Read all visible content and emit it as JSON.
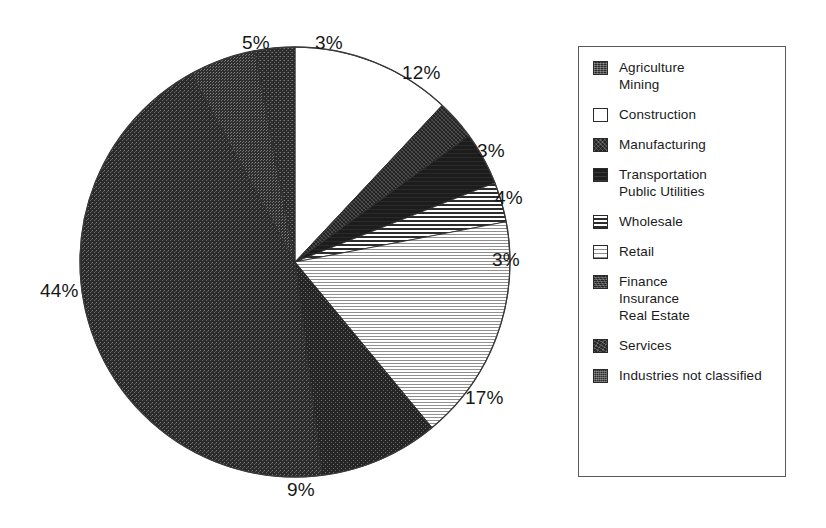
{
  "chart_data": {
    "type": "pie",
    "title": "",
    "subtitle": "",
    "xlabel": "",
    "ylabel": "",
    "grid": false,
    "legend_position": "right",
    "start_angle_deg": 0,
    "direction": "clockwise",
    "center": {
      "x": 295,
      "y": 262
    },
    "radius": 215,
    "categories": [
      "Construction",
      "Manufacturing",
      "Transportation Public Utilities",
      "Wholesale",
      "Retail",
      "Finance Insurance Real Estate",
      "Services",
      "Industries not classified",
      "Agriculture Mining"
    ],
    "values": [
      12,
      3,
      4,
      3,
      17,
      9,
      44,
      5,
      3
    ],
    "labels": [
      "12%",
      "3%",
      "4%",
      "3%",
      "17%",
      "9%",
      "44%",
      "5%",
      "3%"
    ],
    "units": "percent",
    "total": 100,
    "slices": [
      {
        "name": "Construction",
        "value": 12,
        "label": "12%",
        "fill": "white",
        "start_deg": 0,
        "end_deg": 43.2
      },
      {
        "name": "Manufacturing",
        "value": 3,
        "label": "3%",
        "fill": "dark-dense",
        "start_deg": 43.2,
        "end_deg": 54.0
      },
      {
        "name": "Transportation Public Utilities",
        "value": 4,
        "label": "4%",
        "fill": "dark-solid",
        "start_deg": 54.0,
        "end_deg": 68.4
      },
      {
        "name": "Wholesale",
        "value": 3,
        "label": "3%",
        "fill": "hband-dark",
        "start_deg": 68.4,
        "end_deg": 79.2
      },
      {
        "name": "Retail",
        "value": 17,
        "label": "17%",
        "fill": "hband-light",
        "start_deg": 79.2,
        "end_deg": 140.4
      },
      {
        "name": "Finance Insurance Real Estate",
        "value": 9,
        "label": "9%",
        "fill": "dark-grain",
        "start_deg": 140.4,
        "end_deg": 172.8
      },
      {
        "name": "Services",
        "value": 44,
        "label": "44%",
        "fill": "dark-mid",
        "start_deg": 172.8,
        "end_deg": 331.2
      },
      {
        "name": "Industries not classified",
        "value": 5,
        "label": "5%",
        "fill": "dark-nc",
        "start_deg": 331.2,
        "end_deg": 349.2
      },
      {
        "name": "Agriculture Mining",
        "value": 3,
        "label": "3%",
        "fill": "dark-speckle",
        "start_deg": 349.2,
        "end_deg": 360.0
      }
    ]
  },
  "pie_labels": [
    {
      "text": "5%",
      "x": 242,
      "y": 33
    },
    {
      "text": "3%",
      "x": 315,
      "y": 33
    },
    {
      "text": "12%",
      "x": 402,
      "y": 63
    },
    {
      "text": "3%",
      "x": 477,
      "y": 141
    },
    {
      "text": "4%",
      "x": 495,
      "y": 188
    },
    {
      "text": "3%",
      "x": 492,
      "y": 250
    },
    {
      "text": "17%",
      "x": 465,
      "y": 388
    },
    {
      "text": "9%",
      "x": 287,
      "y": 480
    },
    {
      "text": "44%",
      "x": 40,
      "y": 281
    }
  ],
  "legend": {
    "items": [
      {
        "swatch": "dark-speckle",
        "lines": [
          "Agriculture",
          "Mining"
        ]
      },
      {
        "swatch": "white",
        "lines": [
          "Construction"
        ]
      },
      {
        "swatch": "dark-dense",
        "lines": [
          "Manufacturing"
        ]
      },
      {
        "swatch": "dark-solid",
        "lines": [
          "Transportation",
          "Public Utilities"
        ]
      },
      {
        "swatch": "hband-dark",
        "lines": [
          "Wholesale"
        ]
      },
      {
        "swatch": "hband-light",
        "lines": [
          "Retail"
        ]
      },
      {
        "swatch": "dark-grain",
        "lines": [
          "Finance",
          "Insurance",
          "Real Estate"
        ]
      },
      {
        "swatch": "dark-mid",
        "lines": [
          "Services"
        ]
      },
      {
        "swatch": "dark-nc",
        "lines": [
          "Industries not classified"
        ]
      }
    ]
  },
  "colors": {
    "background": "#ffffff",
    "ink": "#1a1a1a",
    "legend_border": "#5a5a5a",
    "pie_outline": "#3a3a3a",
    "dark_fill": "#272727",
    "white_fill": "#ffffff"
  }
}
